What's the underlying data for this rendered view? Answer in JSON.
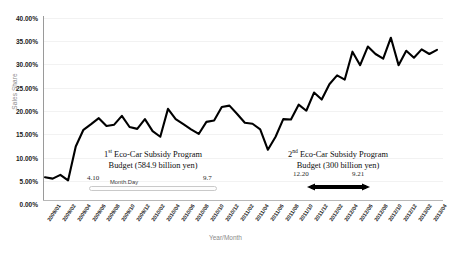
{
  "chart": {
    "ylabel": "Sales Share",
    "xlabel": "Year/Month",
    "yticks": [
      "40.00%",
      "35.00%",
      "30.00%",
      "25.00%",
      "20.00%",
      "15.00%",
      "10.00%",
      "5.00%",
      "0.00%"
    ],
    "xticks": [
      "2009/01",
      "2009/02",
      "2009/04",
      "2009/06",
      "2009/08",
      "2009/10",
      "2009/12",
      "2010/02",
      "2010/04",
      "2010/06",
      "2010/08",
      "2010/10",
      "2010/12",
      "2011/02",
      "2011/04",
      "2011/06",
      "2011/08",
      "2011/10",
      "2011/12",
      "2012/02",
      "2012/04",
      "2012/06",
      "2012/08",
      "2012/10",
      "2012/12",
      "2013/02",
      "2013/04"
    ]
  },
  "annotations": {
    "program1": {
      "line1_prefix": "1",
      "line1_sup": "st",
      "line1_rest": " Eco-Car Subsidy Program",
      "line2": "Budget (584.9 billion yen)",
      "start_date": "4.10",
      "end_date": "9.7",
      "unit_label": "Month.Day"
    },
    "program2": {
      "line1_prefix": "2",
      "line1_sup": "nd",
      "line1_rest": " Eco-Car Subsidy Program",
      "line2": "Budget (300 billion yen)",
      "start_date": "12.20",
      "end_date": "9.21"
    }
  },
  "colors": {
    "line": "#000000",
    "axis": "#9a9a9a",
    "grid": "#f2f2f2",
    "tick_text": "#1a1a1a",
    "axis_title": "#8a8a8a"
  },
  "chart_data": {
    "type": "line",
    "title": "",
    "xlabel": "Year/Month",
    "ylabel": "Sales Share",
    "ylim": [
      0,
      40
    ],
    "ytick_values": [
      0,
      5,
      10,
      15,
      20,
      25,
      30,
      35,
      40
    ],
    "grid": true,
    "legend": "none",
    "x": [
      "2009/01",
      "2009/02",
      "2009/03",
      "2009/04",
      "2009/05",
      "2009/06",
      "2009/07",
      "2009/08",
      "2009/09",
      "2009/10",
      "2009/11",
      "2009/12",
      "2010/01",
      "2010/02",
      "2010/03",
      "2010/04",
      "2010/05",
      "2010/06",
      "2010/07",
      "2010/08",
      "2010/09",
      "2010/10",
      "2010/11",
      "2010/12",
      "2011/01",
      "2011/02",
      "2011/03",
      "2011/04",
      "2011/05",
      "2011/06",
      "2011/07",
      "2011/08",
      "2011/09",
      "2011/10",
      "2011/11",
      "2011/12",
      "2012/01",
      "2012/02",
      "2012/03",
      "2012/04",
      "2012/05",
      "2012/06",
      "2012/07",
      "2012/08",
      "2012/09",
      "2012/10",
      "2012/11",
      "2012/12",
      "2013/01",
      "2013/02",
      "2013/03",
      "2013/04"
    ],
    "series": [
      {
        "name": "Sales Share",
        "values": [
          4.9,
          4.6,
          5.4,
          4.2,
          11.5,
          15.1,
          16.3,
          17.6,
          15.9,
          16.2,
          18.1,
          15.7,
          15.3,
          17.4,
          14.8,
          13.6,
          19.6,
          17.4,
          16.3,
          15.2,
          14.2,
          16.8,
          17.1,
          20.0,
          20.3,
          18.5,
          16.6,
          16.4,
          15.2,
          10.8,
          13.6,
          17.4,
          17.3,
          20.5,
          19.2,
          23.1,
          21.6,
          24.9,
          26.8,
          25.9,
          31.9,
          29.0,
          33.0,
          31.4,
          30.4,
          34.9,
          29.0,
          32.1,
          30.6,
          32.4,
          31.4,
          32.3
        ]
      }
    ],
    "annotations": [
      {
        "label": "1st Eco-Car Subsidy Program Budget (584.9 billion yen)",
        "start": "2009/04/10",
        "end": "2010/09/07",
        "start_label": "4.10",
        "end_label": "9.7",
        "marker": "hollow-bar"
      },
      {
        "label": "2nd Eco-Car Subsidy Program Budget (300 billion yen)",
        "start": "2011/12/20",
        "end": "2012/09/21",
        "start_label": "12.20",
        "end_label": "9.21",
        "marker": "solid-double-arrow"
      }
    ]
  }
}
